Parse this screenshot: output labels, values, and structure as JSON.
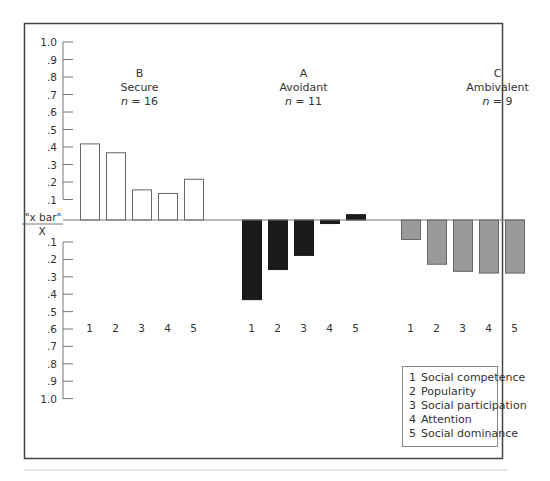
{
  "chart_data": {
    "type": "bar",
    "title": "",
    "xlabel": "",
    "ylabel": "\"x bar\" / X",
    "ylim": [
      -1.0,
      1.0
    ],
    "y_ticks_above": [
      "1.0",
      ".9",
      ".8",
      ".7",
      ".6",
      ".5",
      ".4",
      ".3",
      ".2",
      ".1"
    ],
    "y_ticks_below": [
      ".1",
      ".2",
      ".3",
      ".4",
      ".5",
      ".6",
      ".7",
      ".8",
      ".9",
      "1.0"
    ],
    "y_axis_label_top": "\"x bar\"",
    "y_axis_label_bottom": "X",
    "categories": [
      "1",
      "2",
      "3",
      "4",
      "5"
    ],
    "groups": [
      {
        "code": "B",
        "name": "Secure",
        "n_label": "n",
        "n_value": "= 16",
        "fill": "#ffffff",
        "values": [
          0.43,
          0.38,
          0.17,
          0.15,
          0.23
        ]
      },
      {
        "code": "A",
        "name": "Avoidant",
        "n_label": "n",
        "n_value": "= 11",
        "fill": "#1a1a1a",
        "values": [
          -0.45,
          -0.28,
          -0.2,
          -0.02,
          0.03
        ]
      },
      {
        "code": "C",
        "name": "Ambivalent",
        "n_label": "n",
        "n_value": "= 9",
        "fill": "#9a9a9a",
        "values": [
          -0.11,
          -0.25,
          -0.29,
          -0.3,
          -0.3
        ]
      }
    ],
    "legend": {
      "position": "bottom-right",
      "entries": [
        {
          "num": "1",
          "label": "Social competence"
        },
        {
          "num": "2",
          "label": "Popularity"
        },
        {
          "num": "3",
          "label": "Social participation"
        },
        {
          "num": "4",
          "label": "Attention"
        },
        {
          "num": "5",
          "label": "Social dominance"
        }
      ]
    },
    "grid": false
  }
}
